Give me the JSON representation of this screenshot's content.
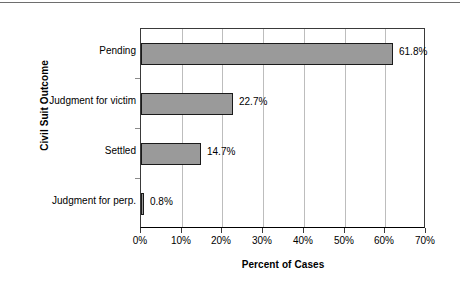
{
  "chart_data": {
    "type": "bar",
    "orientation": "horizontal",
    "title": "",
    "xlabel": "Percent of Cases",
    "ylabel": "Civil Suit Outcome",
    "categories": [
      "Pending",
      "Judgment for victim",
      "Settled",
      "Judgment for perp."
    ],
    "values": [
      61.8,
      22.7,
      14.7,
      0.8
    ],
    "data_labels": [
      "61.8%",
      "22.7%",
      "14.7%",
      "0.8%"
    ],
    "xlim": [
      0,
      70
    ],
    "xticks": [
      0,
      10,
      20,
      30,
      40,
      50,
      60,
      70
    ],
    "xtick_labels": [
      "0%",
      "10%",
      "20%",
      "30%",
      "40%",
      "50%",
      "60%",
      "70%"
    ],
    "grid": "vertical",
    "legend": "none",
    "bar_fill_color": "#9a9a9a",
    "bar_border_color": "#1a1a1a",
    "gridline_color": "#bdbdbd",
    "axis_color": "#000000"
  }
}
